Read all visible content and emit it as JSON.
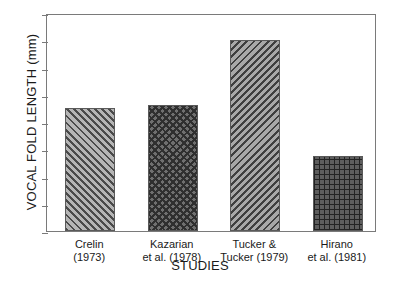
{
  "chart_data": {
    "type": "bar",
    "title": "",
    "xlabel": "STUDIES",
    "ylabel": "VOCAL FOLD LENGTH (mm)",
    "categories": [
      "Crelin (1973)",
      "Kazarian et al. (1978)",
      "Tucker & Tucker (1979)",
      "Hirano et al. (1981)"
    ],
    "category_lines": [
      {
        "line1": "Crelin",
        "line2": "(1973)"
      },
      {
        "line1": "Kazarian",
        "line2": "et al. (1978)"
      },
      {
        "line1": "Tucker &",
        "line2": "Tucker (1979)"
      },
      {
        "line1": "Hirano",
        "line2": "et al. (1981)"
      }
    ],
    "values": [
      4.5,
      4.63,
      7.0,
      2.75
    ],
    "bar_fills": [
      "diagonal-hatch-right",
      "cross-hatch",
      "diagonal-hatch-left",
      "square-grid"
    ],
    "ylim": [
      0,
      8
    ],
    "ytick_values": [
      0,
      1,
      2,
      3,
      4,
      5,
      6,
      7,
      8
    ],
    "ytick_labels": [
      "0",
      "1",
      "2",
      "3",
      "4",
      "5",
      "6",
      "7",
      "8"
    ],
    "grid": false,
    "legend": "none",
    "frame": true,
    "colors": {
      "axis": "#7a7a7a",
      "text": "#1a1a1a",
      "background": "#ffffff",
      "bar_outline": "#5a5a5a"
    }
  }
}
